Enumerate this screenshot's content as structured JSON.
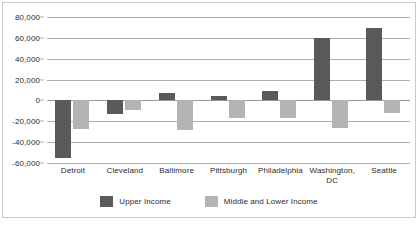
{
  "chart_data": {
    "type": "bar",
    "title": "",
    "subtitle": "",
    "xlabel": "",
    "ylabel": "",
    "categories": [
      "Detroit",
      "Cleveland",
      "Baltimore",
      "Pittsburgh",
      "Philadelphia",
      "Washington, DC",
      "Seattle"
    ],
    "series": [
      {
        "name": "Upper Income",
        "color": "#5a5a5a",
        "values": [
          -55000,
          -13000,
          7000,
          4000,
          9000,
          60000,
          69000
        ]
      },
      {
        "name": "Middle and Lower Income",
        "color": "#b3b3b3",
        "values": [
          -27000,
          -9000,
          -28000,
          -17000,
          -17000,
          -26000,
          -12000
        ]
      }
    ],
    "ylim": [
      -60000,
      80000
    ],
    "yticks": [
      80000,
      60000,
      40000,
      20000,
      0,
      -20000,
      -40000,
      -60000
    ],
    "ytick_labels": [
      "80,000",
      "60,000",
      "40,000",
      "20,000",
      "0",
      "-20,000",
      "-40,000",
      "-60,000"
    ],
    "grid": true,
    "legend_position": "bottom",
    "legend": [
      "Upper Income",
      "Middle and Lower Income"
    ]
  }
}
